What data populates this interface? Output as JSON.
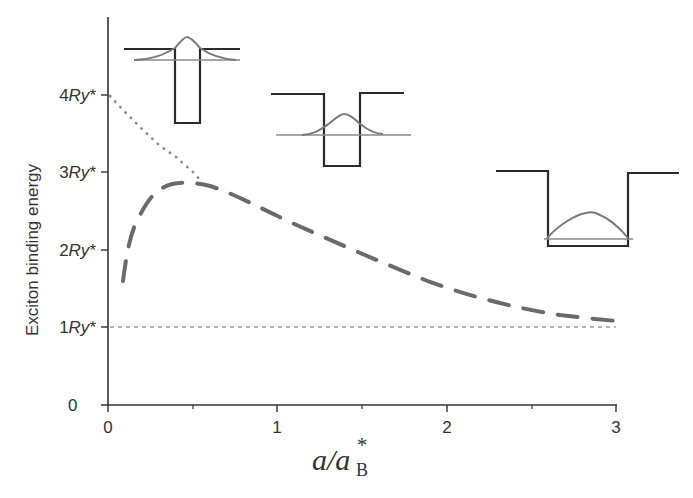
{
  "chart_data": {
    "type": "line",
    "title": "",
    "xlabel": "a/a*_B",
    "ylabel": "Exciton binding energy",
    "xlim": [
      0,
      3
    ],
    "ylim": [
      0,
      4.8
    ],
    "grid": false,
    "legend": null,
    "x_ticks": [
      "0",
      "1",
      "2",
      "3"
    ],
    "x_minor_ticks": [
      0.5,
      1.5,
      2.5
    ],
    "y_ticks": [
      {
        "value": 0,
        "label": "0"
      },
      {
        "value": 1,
        "label": "1Ry*"
      },
      {
        "value": 2,
        "label": "2Ry*"
      },
      {
        "value": 3,
        "label": "3Ry*"
      },
      {
        "value": 4,
        "label": "4Ry*"
      }
    ],
    "series": [
      {
        "name": "ideal-2D-limit",
        "style": "dotted",
        "color": "#8a8a8a",
        "x": [
          0.0,
          0.1,
          0.2,
          0.3,
          0.4,
          0.5,
          0.55
        ],
        "y": [
          4.0,
          3.78,
          3.57,
          3.38,
          3.2,
          3.0,
          2.87
        ]
      },
      {
        "name": "finite-barrier",
        "style": "dashed",
        "color": "#6a6a6a",
        "x": [
          0.1,
          0.15,
          0.2,
          0.25,
          0.3,
          0.4,
          0.5,
          0.6,
          0.8,
          1.0,
          1.2,
          1.4,
          1.6,
          1.8,
          2.0,
          2.2,
          2.4,
          2.6,
          2.8,
          3.0
        ],
        "y": [
          1.6,
          2.1,
          2.45,
          2.68,
          2.8,
          2.86,
          2.86,
          2.8,
          2.62,
          2.42,
          2.2,
          2.0,
          1.82,
          1.65,
          1.5,
          1.38,
          1.27,
          1.19,
          1.12,
          1.08
        ]
      },
      {
        "name": "3D-limit",
        "style": "short-dashed",
        "color": "#9a9a9a",
        "x": [
          0,
          3
        ],
        "y": [
          1.0,
          1.0
        ]
      }
    ],
    "annotations": [
      {
        "type": "inset",
        "description": "narrow deep quantum well with wavefunction spreading outside",
        "position": "top-left near x~0.4"
      },
      {
        "type": "inset",
        "description": "medium quantum well with partially confined wavefunction",
        "position": "near x~1.4"
      },
      {
        "type": "inset",
        "description": "wide quantum well with confined wavefunction",
        "position": "right near x~2.6"
      }
    ]
  },
  "labels": {
    "ylabel": "Exciton binding energy",
    "xlabel_main": "a/a",
    "xlabel_sup": "*",
    "xlabel_sub": "B",
    "y0": "0",
    "y1": "1Ry*",
    "y2": "2Ry*",
    "y3": "3Ry*",
    "y4": "4Ry*",
    "x0": "0",
    "x1": "1",
    "x2": "2",
    "x3": "3"
  },
  "colors": {
    "axis": "#333333",
    "well": "#2a2a2a",
    "wavefunction": "#777777",
    "level": "#9a9a9a",
    "dashed_curve": "#6a6a6a",
    "dotted_curve": "#8a8a8a"
  }
}
